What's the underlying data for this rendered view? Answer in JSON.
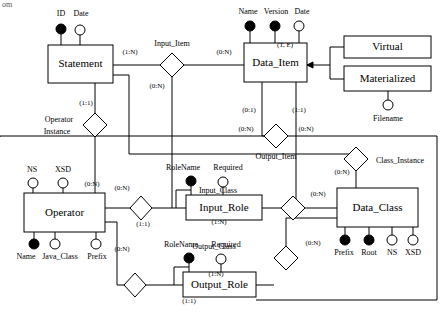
{
  "diagram": {
    "corner_tag": "om",
    "entities": [
      {
        "id": "statement",
        "label": "Statement",
        "x": 48,
        "y": 45,
        "w": 65,
        "h": 38
      },
      {
        "id": "data_item",
        "label": "Data_Item",
        "x": 244,
        "y": 43,
        "w": 63,
        "h": 39
      },
      {
        "id": "virtual",
        "label": "Virtual",
        "x": 344,
        "y": 36,
        "w": 87,
        "h": 22
      },
      {
        "id": "materialized",
        "label": "Materialized",
        "x": 344,
        "y": 66,
        "w": 87,
        "h": 25
      },
      {
        "id": "operator",
        "label": "Operator",
        "x": 24,
        "y": 193,
        "w": 81,
        "h": 39
      },
      {
        "id": "input_role",
        "label": "Input_Role",
        "x": 186,
        "y": 195,
        "w": 76,
        "h": 25
      },
      {
        "id": "output_role",
        "label": "Output_Role",
        "x": 183,
        "y": 272,
        "w": 73,
        "h": 25
      },
      {
        "id": "data_class",
        "label": "Data_Class",
        "x": 337,
        "y": 188,
        "w": 81,
        "h": 39
      }
    ],
    "relationships": [
      {
        "id": "input_item",
        "label": "Input_Item",
        "cx": 172,
        "cy": 65,
        "lx": 172,
        "ly": 46
      },
      {
        "id": "operator_instance",
        "label_line1": "Operator",
        "label_line2": "Instance",
        "cx": 95,
        "cy": 125,
        "lx": 60,
        "ly": 122
      },
      {
        "id": "output_item",
        "label": "Output_Item",
        "cx": 276,
        "cy": 136,
        "lx": 276,
        "ly": 158
      },
      {
        "id": "class_instance",
        "label": "Class_Instance",
        "cx": 356,
        "cy": 159,
        "lx": 397,
        "ly": 163
      },
      {
        "id": "input_class",
        "label": "Input_Class",
        "cx": 293,
        "cy": 208,
        "lx": 219,
        "ly": 193
      },
      {
        "id": "output_class",
        "label": "Output_Class",
        "cx": 286,
        "cy": 258,
        "lx": 215,
        "ly": 249
      },
      {
        "id": "operator_input",
        "label": "",
        "cx": 141,
        "cy": 208,
        "lx": 0,
        "ly": 0
      },
      {
        "id": "operator_output",
        "label": "",
        "cx": 135,
        "cy": 285,
        "lx": 0,
        "ly": 0
      }
    ],
    "attributes": [
      {
        "id": "statement-id",
        "label": "ID",
        "key": true,
        "cx": 61,
        "cy": 29,
        "lx": 61,
        "ly": 16
      },
      {
        "id": "statement-date",
        "label": "Date",
        "key": false,
        "cx": 80,
        "cy": 30,
        "lx": 81,
        "ly": 16
      },
      {
        "id": "dataitem-name",
        "label": "Name",
        "key": true,
        "cx": 250,
        "cy": 26,
        "lx": 248,
        "ly": 14
      },
      {
        "id": "dataitem-version",
        "label": "Version",
        "key": true,
        "cx": 275,
        "cy": 26,
        "lx": 276,
        "ly": 14
      },
      {
        "id": "dataitem-date",
        "label": "Date",
        "key": false,
        "cx": 299,
        "cy": 26,
        "lx": 302,
        "ly": 14
      },
      {
        "id": "materialized-filename",
        "label": "Filename",
        "key": false,
        "cx": 388,
        "cy": 105,
        "lx": 388,
        "ly": 121
      },
      {
        "id": "operator-ns",
        "label": "NS",
        "key": false,
        "cx": 33,
        "cy": 183,
        "lx": 32,
        "ly": 172
      },
      {
        "id": "operator-xsd",
        "label": "XSD",
        "key": false,
        "cx": 63,
        "cy": 183,
        "lx": 63,
        "ly": 172
      },
      {
        "id": "operator-name",
        "label": "Name",
        "key": true,
        "cx": 34,
        "cy": 244,
        "lx": 25,
        "ly": 259
      },
      {
        "id": "operator-javaclass",
        "label": "Java_Class",
        "key": false,
        "cx": 55,
        "cy": 244,
        "lx": 58,
        "ly": 259
      },
      {
        "id": "operator-prefix",
        "label": "Prefix",
        "key": false,
        "cx": 96,
        "cy": 244,
        "lx": 97,
        "ly": 259
      },
      {
        "id": "inputrole-rolename",
        "label": "RoleName",
        "key": true,
        "cx": 191,
        "cy": 181,
        "lx": 183,
        "ly": 170
      },
      {
        "id": "inputrole-required",
        "label": "Required",
        "key": false,
        "cx": 223,
        "cy": 182,
        "lx": 228,
        "ly": 170
      },
      {
        "id": "outputrole-rolename",
        "label": "RoleName",
        "key": true,
        "cx": 189,
        "cy": 258,
        "lx": 181,
        "ly": 247
      },
      {
        "id": "outputrole-required",
        "label": "Required",
        "key": false,
        "cx": 221,
        "cy": 259,
        "lx": 226,
        "ly": 247
      },
      {
        "id": "dataclass-prefix",
        "label": "Prefix",
        "key": true,
        "cx": 345,
        "cy": 240,
        "lx": 344,
        "ly": 255
      },
      {
        "id": "dataclass-root",
        "label": "Root",
        "key": true,
        "cx": 369,
        "cy": 240,
        "lx": 369,
        "ly": 255
      },
      {
        "id": "dataclass-ns",
        "label": "NS",
        "key": false,
        "cx": 392,
        "cy": 240,
        "lx": 392,
        "ly": 255
      },
      {
        "id": "dataclass-xsd",
        "label": "XSD",
        "key": false,
        "cx": 413,
        "cy": 240,
        "lx": 413,
        "ly": 255
      }
    ],
    "cardinalities": [
      {
        "id": "card-stmt-inputitem",
        "text": "(1:N)",
        "x": 130,
        "y": 54
      },
      {
        "id": "card-inputitem-dataitem",
        "text": "(0:N)",
        "x": 224,
        "y": 54
      },
      {
        "id": "card-inputitem-down",
        "text": "(0:N)",
        "x": 157,
        "y": 88
      },
      {
        "id": "card-stmt-opinst",
        "text": "(1:1)",
        "x": 86,
        "y": 105
      },
      {
        "id": "card-dataitem-outitem",
        "text": "(0:1)",
        "x": 249,
        "y": 112
      },
      {
        "id": "card-dataitem-down2",
        "text": "(1:1)",
        "x": 299,
        "y": 112
      },
      {
        "id": "card-outitem-left",
        "text": "(0:N)",
        "x": 246,
        "y": 131
      },
      {
        "id": "card-outitem-right",
        "text": "(0:N)",
        "x": 306,
        "y": 131
      },
      {
        "id": "card-classinst",
        "text": "(0:N)",
        "x": 342,
        "y": 174
      },
      {
        "id": "card-opinst-down",
        "text": "(0:N)",
        "x": 92,
        "y": 186
      },
      {
        "id": "card-operator-inputrole",
        "text": "(0:N)",
        "x": 122,
        "y": 190
      },
      {
        "id": "card-inputrole-left",
        "text": "(1:1)",
        "x": 143,
        "y": 226
      },
      {
        "id": "card-inputclass-right",
        "text": "(0:N)",
        "x": 318,
        "y": 196
      },
      {
        "id": "card-inputrole-right",
        "text": "(1:N)",
        "x": 219,
        "y": 224
      },
      {
        "id": "card-operator-outputrole",
        "text": "(0:N)",
        "x": 122,
        "y": 251
      },
      {
        "id": "card-outputclass-right",
        "text": "(0:N)",
        "x": 313,
        "y": 245
      },
      {
        "id": "card-outputrole-right",
        "text": "(1:N)",
        "x": 216,
        "y": 276
      },
      {
        "id": "card-outputrole-left",
        "text": "(1:1)",
        "x": 189,
        "y": 303
      },
      {
        "id": "card-isa",
        "text": "(T, E)",
        "x": 285,
        "y": 47
      }
    ],
    "isa": {
      "label": "(T, E)",
      "disjoint_marker": "arrow"
    },
    "colors": {
      "stroke": "#000000",
      "fill": "#ffffff",
      "text": "#000000"
    }
  }
}
